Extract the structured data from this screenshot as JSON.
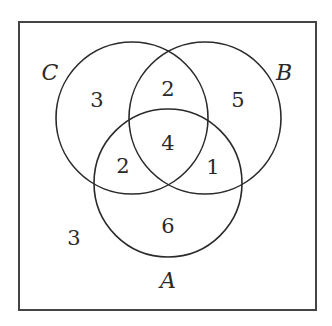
{
  "diagram": {
    "type": "venn-3",
    "sets": {
      "A": {
        "label": "A"
      },
      "B": {
        "label": "B"
      },
      "C": {
        "label": "C"
      }
    },
    "regions": {
      "C_only": "3",
      "B_and_C_only": "2",
      "B_only": "5",
      "A_and_B_and_C": "4",
      "A_and_C_only": "2",
      "A_and_B_only": "1",
      "A_only": "6",
      "outside": "3"
    },
    "colors": {
      "stroke": "#2a2a2a",
      "background": "#ffffff"
    }
  }
}
